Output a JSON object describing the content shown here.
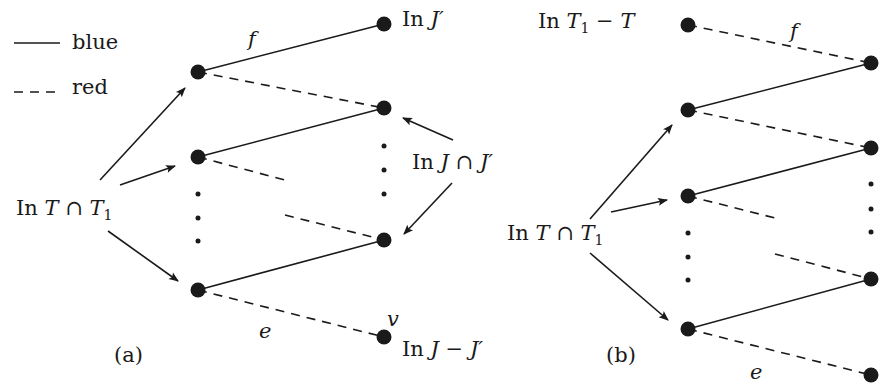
{
  "legend": {
    "items": [
      {
        "style": "solid",
        "label": "blue"
      },
      {
        "style": "dashed",
        "label": "red"
      }
    ]
  },
  "panels": [
    {
      "id": "a",
      "caption": "(a)",
      "source_label": {
        "prefix": "In ",
        "t": "T",
        "cap": " ∩ ",
        "t1": "T",
        "sub": "1"
      },
      "labels": {
        "top_right": {
          "prefix": "In ",
          "var": "J′"
        },
        "middle_right": {
          "prefix": "In ",
          "var1": "J",
          "op": " ∩ ",
          "var2": "J′"
        },
        "bottom_right": {
          "prefix": "In ",
          "var1": "J",
          "op": " − ",
          "var2": "J′"
        },
        "edge_f": "f",
        "edge_e": "e",
        "vertex_v": "v"
      },
      "nodes_left": [
        [
          198,
          72
        ],
        [
          198,
          157
        ],
        [
          198,
          290
        ]
      ],
      "nodes_right": [
        [
          384,
          24
        ],
        [
          384,
          108
        ],
        [
          384,
          240
        ],
        [
          384,
          337
        ]
      ],
      "dots_left": [
        [
          198,
          194
        ],
        [
          198,
          218
        ],
        [
          198,
          241
        ]
      ],
      "dots_right": [
        [
          384,
          146
        ],
        [
          384,
          170
        ],
        [
          384,
          194
        ]
      ]
    },
    {
      "id": "b",
      "caption": "(b)",
      "source_label": {
        "prefix": "In ",
        "t": "T",
        "cap": " ∩ ",
        "t1": "T",
        "sub": "1"
      },
      "labels": {
        "top_left": {
          "prefix": "In ",
          "t1": "T",
          "sub": "1",
          "op": " − ",
          "t": "T"
        },
        "edge_f": "f",
        "edge_e": "e"
      },
      "nodes_left": [
        [
          688,
          25
        ],
        [
          688,
          110
        ],
        [
          688,
          196
        ],
        [
          688,
          329
        ]
      ],
      "nodes_right": [
        [
          871,
          63
        ],
        [
          871,
          148
        ],
        [
          871,
          279
        ],
        [
          871,
          375
        ]
      ],
      "dots_left": [
        [
          688,
          233
        ],
        [
          688,
          257
        ],
        [
          688,
          280
        ]
      ],
      "dots_right": [
        [
          871,
          184
        ],
        [
          871,
          209
        ],
        [
          871,
          232
        ]
      ]
    }
  ]
}
